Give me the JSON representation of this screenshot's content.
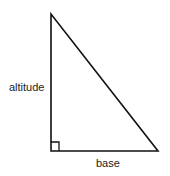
{
  "diagram": {
    "type": "right-triangle",
    "labels": {
      "altitude": "altitude",
      "base": "base"
    },
    "vertices": {
      "top": [
        51,
        14
      ],
      "right_angle": [
        51,
        151
      ],
      "base_end": [
        158,
        151
      ]
    },
    "right_angle_marker": true,
    "stroke_color": "#111111"
  }
}
